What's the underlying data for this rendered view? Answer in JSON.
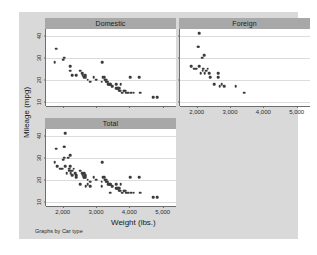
{
  "figure": {
    "background_color": "#d9d9d9",
    "plot_background_color": "#ffffff",
    "title_band_color": "#a8a8a8",
    "marker_color": "#3c3c3c",
    "note": "Graphs by Car type"
  },
  "chart_data": {
    "type": "scatter",
    "title": "",
    "xlabel": "Weight (lbs.)",
    "ylabel": "Mileage (mpg)",
    "xlim": [
      1500,
      5400
    ],
    "ylim": [
      8,
      43
    ],
    "xticks": [
      2000,
      3000,
      4000,
      5000
    ],
    "xticklabels": [
      "2,000",
      "3,000",
      "4,000",
      "5,000"
    ],
    "yticks": [
      10,
      20,
      30,
      40
    ],
    "yticklabels": [
      "10",
      "20",
      "30",
      "40"
    ],
    "grid": true,
    "grid_axis": "y",
    "legend": "none",
    "panel_by": "Car type",
    "panels": [
      {
        "label": "Domestic",
        "position": "top-left",
        "n": 52,
        "points": [
          [
            1800,
            34
          ],
          [
            1760,
            28
          ],
          [
            2020,
            29
          ],
          [
            2050,
            30
          ],
          [
            2230,
            26
          ],
          [
            2230,
            24
          ],
          [
            2280,
            22
          ],
          [
            2400,
            22
          ],
          [
            2520,
            24
          ],
          [
            2580,
            23
          ],
          [
            2600,
            22
          ],
          [
            2650,
            21
          ],
          [
            2670,
            22
          ],
          [
            2690,
            21
          ],
          [
            2750,
            20
          ],
          [
            2830,
            19
          ],
          [
            2930,
            21
          ],
          [
            3000,
            20
          ],
          [
            3180,
            28
          ],
          [
            3170,
            19
          ],
          [
            3200,
            21
          ],
          [
            3250,
            21
          ],
          [
            3260,
            20
          ],
          [
            3280,
            20
          ],
          [
            3300,
            20
          ],
          [
            3310,
            19
          ],
          [
            3330,
            19
          ],
          [
            3350,
            19
          ],
          [
            3370,
            18
          ],
          [
            3380,
            18
          ],
          [
            3420,
            18
          ],
          [
            3430,
            18
          ],
          [
            3470,
            17
          ],
          [
            3500,
            17
          ],
          [
            3600,
            18
          ],
          [
            3600,
            16
          ],
          [
            3630,
            16
          ],
          [
            3670,
            16
          ],
          [
            3690,
            15
          ],
          [
            3700,
            16
          ],
          [
            3720,
            15
          ],
          [
            3740,
            18
          ],
          [
            3790,
            14
          ],
          [
            3830,
            15
          ],
          [
            3850,
            15
          ],
          [
            3880,
            15
          ],
          [
            3900,
            14
          ],
          [
            3960,
            14
          ],
          [
            4030,
            21
          ],
          [
            4060,
            14
          ],
          [
            4130,
            14
          ],
          [
            4290,
            21
          ],
          [
            4330,
            14
          ],
          [
            4720,
            12
          ],
          [
            4840,
            12
          ]
        ]
      },
      {
        "label": "Foreign",
        "position": "top-right",
        "n": 22,
        "points": [
          [
            2070,
            41
          ],
          [
            2040,
            35
          ],
          [
            2050,
            35
          ],
          [
            2160,
            30
          ],
          [
            2230,
            31
          ],
          [
            1830,
            26
          ],
          [
            1930,
            25
          ],
          [
            1990,
            25
          ],
          [
            2070,
            26
          ],
          [
            2120,
            23
          ],
          [
            2180,
            24
          ],
          [
            2200,
            25
          ],
          [
            2240,
            23
          ],
          [
            2280,
            24
          ],
          [
            2330,
            25
          ],
          [
            2370,
            23
          ],
          [
            2410,
            21
          ],
          [
            2520,
            18
          ],
          [
            2650,
            23
          ],
          [
            2650,
            21
          ],
          [
            2690,
            17
          ],
          [
            2750,
            18
          ],
          [
            2830,
            17
          ],
          [
            3170,
            17
          ],
          [
            3420,
            14
          ]
        ]
      },
      {
        "label": "Total",
        "position": "bottom-left",
        "n": 74,
        "points": [
          [
            2070,
            41
          ],
          [
            1800,
            34
          ],
          [
            2040,
            35
          ],
          [
            2050,
            35
          ],
          [
            1760,
            28
          ],
          [
            1830,
            26
          ],
          [
            1930,
            25
          ],
          [
            1990,
            25
          ],
          [
            2020,
            29
          ],
          [
            2050,
            30
          ],
          [
            2070,
            26
          ],
          [
            2120,
            23
          ],
          [
            2160,
            30
          ],
          [
            2180,
            24
          ],
          [
            2200,
            25
          ],
          [
            2230,
            31
          ],
          [
            2230,
            26
          ],
          [
            2230,
            24
          ],
          [
            2240,
            23
          ],
          [
            2280,
            24
          ],
          [
            2280,
            22
          ],
          [
            2330,
            25
          ],
          [
            2370,
            23
          ],
          [
            2400,
            22
          ],
          [
            2410,
            21
          ],
          [
            2520,
            24
          ],
          [
            2520,
            18
          ],
          [
            2580,
            23
          ],
          [
            2600,
            22
          ],
          [
            2650,
            23
          ],
          [
            2650,
            21
          ],
          [
            2650,
            21
          ],
          [
            2670,
            22
          ],
          [
            2690,
            21
          ],
          [
            2690,
            17
          ],
          [
            2750,
            20
          ],
          [
            2750,
            18
          ],
          [
            2830,
            19
          ],
          [
            2830,
            17
          ],
          [
            2930,
            21
          ],
          [
            3000,
            20
          ],
          [
            3170,
            17
          ],
          [
            3170,
            19
          ],
          [
            3180,
            28
          ],
          [
            3200,
            21
          ],
          [
            3250,
            21
          ],
          [
            3260,
            20
          ],
          [
            3280,
            20
          ],
          [
            3300,
            20
          ],
          [
            3310,
            19
          ],
          [
            3330,
            19
          ],
          [
            3350,
            19
          ],
          [
            3370,
            18
          ],
          [
            3380,
            18
          ],
          [
            3420,
            18
          ],
          [
            3420,
            14
          ],
          [
            3430,
            18
          ],
          [
            3470,
            17
          ],
          [
            3500,
            17
          ],
          [
            3600,
            18
          ],
          [
            3600,
            16
          ],
          [
            3630,
            16
          ],
          [
            3670,
            16
          ],
          [
            3690,
            15
          ],
          [
            3700,
            16
          ],
          [
            3720,
            15
          ],
          [
            3740,
            18
          ],
          [
            3790,
            14
          ],
          [
            3830,
            15
          ],
          [
            3850,
            15
          ],
          [
            3880,
            15
          ],
          [
            3900,
            14
          ],
          [
            3960,
            14
          ],
          [
            4030,
            21
          ],
          [
            4060,
            14
          ],
          [
            4130,
            14
          ],
          [
            4290,
            21
          ],
          [
            4330,
            14
          ],
          [
            4720,
            12
          ],
          [
            4840,
            12
          ]
        ]
      }
    ]
  }
}
